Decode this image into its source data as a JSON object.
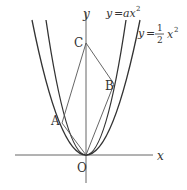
{
  "diagram": {
    "type": "coordinate-geometry",
    "axes": {
      "x_label": "x",
      "y_label": "y",
      "origin_label": "O"
    },
    "curves": [
      {
        "name": "inner-parabola",
        "equation_lhs": "y",
        "equation_rhs": "ax",
        "exponent": "2",
        "label": "y = ax²"
      },
      {
        "name": "outer-parabola",
        "equation_lhs": "y",
        "fraction_num": "1",
        "fraction_den": "2",
        "rhs_var": "x",
        "exponent": "2",
        "label": "y = 1/2 x²"
      }
    ],
    "points": [
      {
        "name": "A",
        "label": "A",
        "on": "y = 1/2 x²"
      },
      {
        "name": "B",
        "label": "B",
        "on": "y = ax²"
      },
      {
        "name": "C",
        "label": "C",
        "on": "y-axis"
      },
      {
        "name": "O",
        "label": "O",
        "on": "origin"
      }
    ],
    "segments": [
      "CA",
      "CB",
      "OA",
      "OB"
    ],
    "colors": {
      "line": "#555555",
      "curve": "#333333",
      "axis": "#666666",
      "text": "#333333"
    }
  }
}
